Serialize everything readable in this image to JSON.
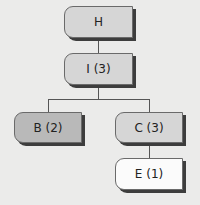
{
  "diagram": {
    "type": "tree",
    "nodes": [
      {
        "id": "H",
        "label": "H",
        "fill": "#d6d6d6"
      },
      {
        "id": "I",
        "label": "I (3)",
        "fill": "#d6d6d6"
      },
      {
        "id": "B",
        "label": "B (2)",
        "fill": "#b9b9b9"
      },
      {
        "id": "C",
        "label": "C (3)",
        "fill": "#d6d6d6"
      },
      {
        "id": "E",
        "label": "E (1)",
        "fill": "#fbfbfb"
      }
    ],
    "edges": [
      {
        "from": "H",
        "to": "I"
      },
      {
        "from": "I",
        "to": "B"
      },
      {
        "from": "I",
        "to": "C"
      },
      {
        "from": "C",
        "to": "E"
      }
    ]
  }
}
